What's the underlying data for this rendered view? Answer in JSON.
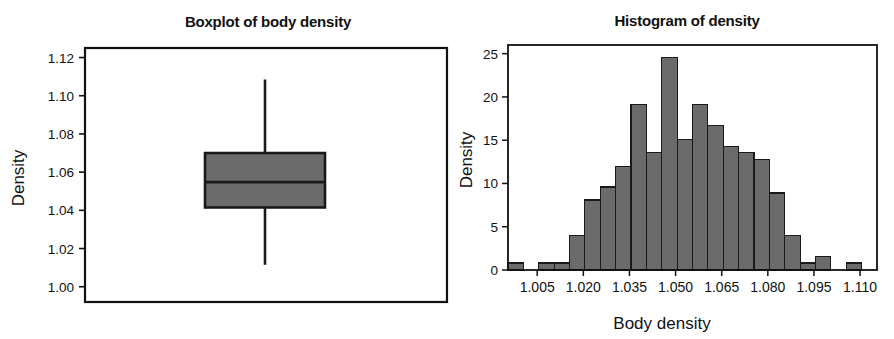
{
  "figure": {
    "background_color": "#ffffff",
    "ink_color": "#111111",
    "bar_fill_color": "#6b6b6b",
    "bar_edge_color": "#1a1a1a"
  },
  "panels": [
    {
      "id": "boxplot",
      "title": "Boxplot of body density",
      "ylabel": "Density",
      "xlabel": ""
    },
    {
      "id": "histogram",
      "title": "Histogram of density",
      "ylabel": "Density",
      "xlabel": "Body density"
    }
  ],
  "chart_data": [
    {
      "type": "box",
      "title": "Boxplot of body density",
      "xlabel": "",
      "ylabel": "Density",
      "ylim": [
        0.992,
        1.125
      ],
      "yticks": [
        1.0,
        1.02,
        1.04,
        1.06,
        1.08,
        1.1,
        1.12
      ],
      "ytick_labels": [
        "1.00",
        "1.02",
        "1.04",
        "1.06",
        "1.08",
        "1.10",
        "1.12"
      ],
      "grid": false,
      "legend": "none",
      "boxes": [
        {
          "name": "body density",
          "whisker_low": 1.0115,
          "q1": 1.0415,
          "median": 1.0548,
          "q3": 1.07,
          "whisker_high": 1.1085,
          "outliers": []
        }
      ]
    },
    {
      "type": "bar",
      "subtype": "histogram",
      "title": "Histogram of density",
      "xlabel": "Body density",
      "ylabel": "Density",
      "xlim": [
        0.9955,
        1.1155
      ],
      "ylim": [
        0,
        26
      ],
      "xticks": [
        1.005,
        1.02,
        1.035,
        1.05,
        1.065,
        1.08,
        1.095,
        1.11
      ],
      "xtick_labels": [
        "1.005",
        "1.020",
        "1.035",
        "1.050",
        "1.065",
        "1.080",
        "1.095",
        "1.110"
      ],
      "yticks": [
        0,
        5,
        10,
        15,
        20,
        25
      ],
      "ytick_labels": [
        "0",
        "5",
        "10",
        "15",
        "20",
        "25"
      ],
      "grid": false,
      "legend": "none",
      "bin_width": 0.005,
      "bin_starts": [
        0.9955,
        1.0005,
        1.0055,
        1.0105,
        1.0155,
        1.0205,
        1.0255,
        1.0305,
        1.0355,
        1.0405,
        1.0455,
        1.0505,
        1.0555,
        1.0605,
        1.0655,
        1.0705,
        1.0755,
        1.0805,
        1.0855,
        1.0905,
        1.0955,
        1.1005,
        1.1055,
        1.1105
      ],
      "categories": [
        "0.9955",
        "1.0005",
        "1.0055",
        "1.0105",
        "1.0155",
        "1.0205",
        "1.0255",
        "1.0305",
        "1.0355",
        "1.0405",
        "1.0455",
        "1.0505",
        "1.0555",
        "1.0605",
        "1.0655",
        "1.0705",
        "1.0755",
        "1.0805",
        "1.0855",
        "1.0905",
        "1.0955",
        "1.1005",
        "1.1055",
        "1.1105"
      ],
      "values": [
        0.8,
        0,
        0.8,
        0.8,
        4.0,
        8.1,
        9.6,
        12.0,
        19.1,
        13.6,
        24.6,
        15.1,
        19.1,
        16.7,
        14.3,
        13.6,
        12.8,
        8.9,
        4.0,
        0.8,
        1.6,
        0,
        0.8,
        0
      ]
    }
  ]
}
